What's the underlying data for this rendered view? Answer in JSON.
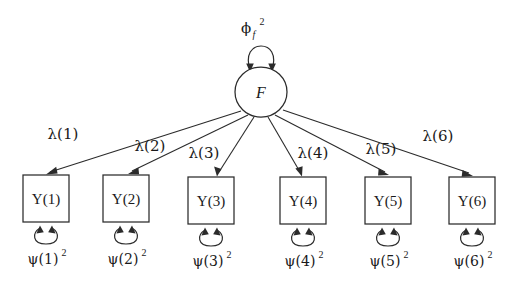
{
  "figure": {
    "type": "path-diagram",
    "domain": "structural-equation-model",
    "background_color": "#ffffff",
    "stroke_color": "#2b2b2b",
    "width": 520,
    "height": 288
  },
  "latent": {
    "name": "F",
    "label": "F",
    "shape": "ellipse",
    "cx": 261,
    "cy": 92,
    "rx": 26,
    "ry": 25
  },
  "latent_variance": {
    "symbol": "ϕ",
    "subscript": "f",
    "superscript": "2",
    "plain": "ϕf2",
    "label_x": 250,
    "label_y": 32
  },
  "indicators": [
    {
      "label": "Y(1)",
      "x": 23,
      "y": 175,
      "w": 46,
      "h": 47,
      "cx": 46
    },
    {
      "label": "Y(2)",
      "x": 103,
      "y": 175,
      "w": 46,
      "h": 47,
      "cx": 126
    },
    {
      "label": "Y(3)",
      "x": 188,
      "y": 177,
      "w": 46,
      "h": 47,
      "cx": 211
    },
    {
      "label": "Y(4)",
      "x": 280,
      "y": 177,
      "w": 46,
      "h": 47,
      "cx": 303
    },
    {
      "label": "Y(5)",
      "x": 365,
      "y": 177,
      "w": 46,
      "h": 47,
      "cx": 388
    },
    {
      "label": "Y(6)",
      "x": 449,
      "y": 177,
      "w": 46,
      "h": 47,
      "cx": 472
    }
  ],
  "loadings": [
    {
      "symbol": "λ",
      "label": "λ(1)",
      "index": 1,
      "label_x": 45,
      "label_y": 139,
      "from": [
        241,
        114
      ],
      "to": [
        48,
        174
      ]
    },
    {
      "symbol": "λ",
      "label": "λ(2)",
      "index": 2,
      "label_x": 131,
      "label_y": 151,
      "from": [
        248,
        116
      ],
      "to": [
        131,
        174
      ]
    },
    {
      "symbol": "λ",
      "label": "λ(3)",
      "index": 3,
      "label_x": 186,
      "label_y": 158,
      "from": [
        255,
        118
      ],
      "to": [
        217,
        176
      ]
    },
    {
      "symbol": "λ",
      "label": "λ(4)",
      "index": 4,
      "label_x": 294,
      "label_y": 158,
      "from": [
        268,
        118
      ],
      "to": [
        301,
        176
      ]
    },
    {
      "symbol": "λ",
      "label": "λ(5)",
      "index": 5,
      "label_x": 363,
      "label_y": 154,
      "from": [
        275,
        116
      ],
      "to": [
        386,
        176
      ]
    },
    {
      "symbol": "λ",
      "label": "λ(6)",
      "index": 6,
      "label_x": 420,
      "label_y": 141,
      "from": [
        282,
        112
      ],
      "to": [
        470,
        176
      ]
    }
  ],
  "residuals": [
    {
      "symbol": "ψ",
      "label": "ψ(1)",
      "superscript": "2",
      "plain": "ψ(1)2",
      "label_x": 46,
      "label_y": 263
    },
    {
      "symbol": "ψ",
      "label": "ψ(2)",
      "superscript": "2",
      "plain": "ψ(2)2",
      "label_x": 126,
      "label_y": 263
    },
    {
      "symbol": "ψ",
      "label": "ψ(3)",
      "superscript": "2",
      "plain": "ψ(3)2",
      "label_x": 211,
      "label_y": 263
    },
    {
      "symbol": "ψ",
      "label": "ψ(4)",
      "superscript": "2",
      "plain": "ψ(4)2",
      "label_x": 303,
      "label_y": 263
    },
    {
      "symbol": "ψ",
      "label": "ψ(5)",
      "superscript": "2",
      "plain": "ψ(5)2",
      "label_x": 388,
      "label_y": 263
    },
    {
      "symbol": "ψ",
      "label": "ψ(6)",
      "superscript": "2",
      "plain": "ψ(6)2",
      "label_x": 472,
      "label_y": 263
    }
  ]
}
